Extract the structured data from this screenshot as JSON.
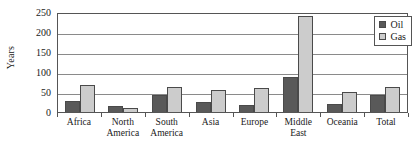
{
  "chart_data": {
    "type": "bar",
    "title": "",
    "xlabel": "",
    "ylabel": "Years",
    "ylim": [
      0,
      250
    ],
    "yticks": [
      0,
      50,
      100,
      150,
      200,
      250
    ],
    "ytick_labels": [
      "0",
      "50",
      "100",
      "150",
      "200",
      "250"
    ],
    "grid": true,
    "legend_position": "top-right",
    "categories": [
      "Africa",
      "North America",
      "South America",
      "Asia",
      "Europe",
      "Middle East",
      "Oceania",
      "Total"
    ],
    "category_lines": [
      {
        "line1": "Africa",
        "line2": ""
      },
      {
        "line1": "North",
        "line2": "America"
      },
      {
        "line1": "South",
        "line2": "America"
      },
      {
        "line1": "Asia",
        "line2": ""
      },
      {
        "line1": "Europe",
        "line2": ""
      },
      {
        "line1": "Middle",
        "line2": "East"
      },
      {
        "line1": "Oceania",
        "line2": ""
      },
      {
        "line1": "Total",
        "line2": ""
      }
    ],
    "series": [
      {
        "name": "Oil",
        "color": "#595959",
        "values": [
          28,
          15,
          42,
          24,
          17,
          88,
          21,
          43
        ]
      },
      {
        "name": "Gas",
        "color": "#cccccc",
        "values": [
          67,
          9,
          62,
          55,
          61,
          240,
          50,
          62
        ]
      }
    ]
  },
  "legend": {
    "items": [
      {
        "label": "Oil",
        "swatch": "oil-swatch"
      },
      {
        "label": "Gas",
        "swatch": "gas-swatch"
      }
    ]
  }
}
